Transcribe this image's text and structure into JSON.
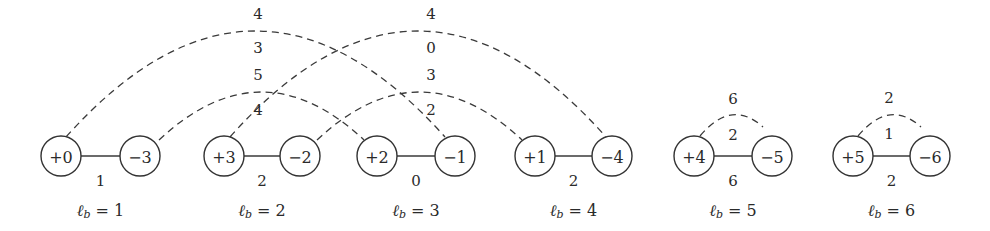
{
  "diagram": {
    "node_radius": 20,
    "node_y": 156,
    "stroke_color": "#333333",
    "blocks": [
      {
        "id": 1,
        "plus": {
          "label": "+0",
          "x": 61
        },
        "minus": {
          "label": "−3",
          "x": 140
        },
        "edge_weight": "1",
        "lb_value": "1"
      },
      {
        "id": 2,
        "plus": {
          "label": "+3",
          "x": 224
        },
        "minus": {
          "label": "−2",
          "x": 300
        },
        "edge_weight": "2",
        "lb_value": "2"
      },
      {
        "id": 3,
        "plus": {
          "label": "+2",
          "x": 377
        },
        "minus": {
          "label": "−1",
          "x": 455
        },
        "edge_weight": "0",
        "lb_value": "3"
      },
      {
        "id": 4,
        "plus": {
          "label": "+1",
          "x": 535
        },
        "minus": {
          "label": "−4",
          "x": 612
        },
        "edge_weight": "2",
        "lb_value": "4"
      },
      {
        "id": 5,
        "plus": {
          "label": "+4",
          "x": 694
        },
        "minus": {
          "label": "−5",
          "x": 772
        },
        "edge_weight": "6",
        "lb_value": "5"
      },
      {
        "id": 6,
        "plus": {
          "label": "+5",
          "x": 853
        },
        "minus": {
          "label": "−6",
          "x": 930
        },
        "edge_weight": "2",
        "lb_value": "6"
      }
    ],
    "lb_prefix": "ℓ",
    "lb_subscript": "b",
    "lb_equals": " = ",
    "arcs": [
      {
        "from": "+0",
        "to": "−1",
        "x1": 66,
        "y1": 137,
        "x2": 445,
        "y2": 137,
        "peak_y": 31,
        "label_above": "4",
        "label_below": "3",
        "label_x": 258
      },
      {
        "from": "+3",
        "to": "−4",
        "x1": 230,
        "y1": 137,
        "x2": 606,
        "y2": 137,
        "peak_y": 31,
        "label_above": "4",
        "label_below": "0",
        "label_x": 431
      },
      {
        "from": "−3",
        "to": "+2",
        "x1": 159,
        "y1": 140,
        "x2": 364,
        "y2": 140,
        "peak_y": 92,
        "label_above": "5",
        "label_below": "4",
        "label_x": 258
      },
      {
        "from": "−2",
        "to": "+1",
        "x1": 317,
        "y1": 140,
        "x2": 522,
        "y2": 140,
        "peak_y": 92,
        "label_above": "3",
        "label_below": "2",
        "label_x": 431
      },
      {
        "from": "+4",
        "to": "−5",
        "x1": 700,
        "y1": 136,
        "x2": 763,
        "y2": 127,
        "peak_y": 115,
        "label_above": "6",
        "label_below": "2",
        "label_x": 733
      },
      {
        "from": "+5",
        "to": "−6",
        "x1": 858,
        "y1": 136,
        "x2": 921,
        "y2": 127,
        "peak_y": 115,
        "label_above": "2",
        "label_below": "1",
        "label_x": 889
      }
    ],
    "arc_label_offsets": {
      "0": {
        "above_y": 14,
        "below_y": 48
      },
      "1": {
        "above_y": 14,
        "below_y": 48
      },
      "2": {
        "above_y": 75,
        "below_y": 110
      },
      "3": {
        "above_y": 75,
        "below_y": 110
      },
      "4": {
        "above_y": 99,
        "below_y": 135
      },
      "5": {
        "above_y": 98,
        "below_y": 134
      }
    }
  }
}
